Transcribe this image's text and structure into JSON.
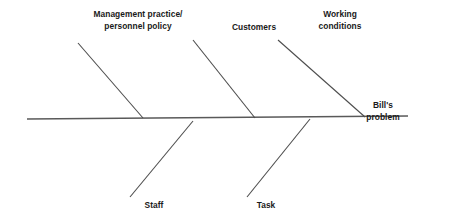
{
  "diagram": {
    "type": "fishbone-ishikawa",
    "effect": {
      "lines": [
        "Bill's",
        "problem"
      ],
      "x": 414,
      "y": 100,
      "align": "right"
    },
    "spine": {
      "x1": 27,
      "y1": 119,
      "x2": 408,
      "y2": 116,
      "color": "#595959",
      "width": 1.3
    },
    "bone_color": "#4d4d4d",
    "bone_width": 1.1,
    "causes": [
      {
        "id": "management-practice-personnel-policy",
        "lines": [
          "Management practice/",
          "personnel policy"
        ],
        "side": "upper",
        "label_x": 78,
        "label_y": 9,
        "label_align": "center",
        "label_width": 120,
        "bone": {
          "x1": 78,
          "y1": 43,
          "x2": 143,
          "y2": 118
        }
      },
      {
        "id": "customers",
        "lines": [
          "Customers"
        ],
        "side": "upper",
        "label_x": 213,
        "label_y": 22,
        "label_align": "center",
        "label_width": 82,
        "bone": {
          "x1": 193,
          "y1": 40,
          "x2": 255,
          "y2": 118
        }
      },
      {
        "id": "working-conditions",
        "lines": [
          "Working",
          "conditions"
        ],
        "side": "upper",
        "label_x": 302,
        "label_y": 9,
        "label_align": "center",
        "label_width": 76,
        "bone": {
          "x1": 278,
          "y1": 40,
          "x2": 365,
          "y2": 117
        }
      },
      {
        "id": "staff",
        "lines": [
          "Staff"
        ],
        "side": "lower",
        "label_x": 129,
        "label_y": 200,
        "label_align": "center",
        "label_width": 50,
        "bone": {
          "x1": 130,
          "y1": 197,
          "x2": 193,
          "y2": 121
        }
      },
      {
        "id": "task",
        "lines": [
          "Task"
        ],
        "side": "lower",
        "label_x": 241,
        "label_y": 200,
        "label_align": "center",
        "label_width": 50,
        "bone": {
          "x1": 247,
          "y1": 197,
          "x2": 310,
          "y2": 119
        }
      }
    ]
  }
}
